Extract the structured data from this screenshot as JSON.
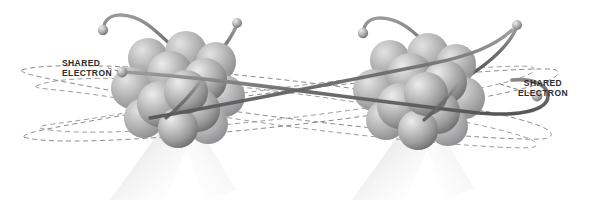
{
  "diagram": {
    "background_color": "#ffffff",
    "labels": [
      {
        "id": "left",
        "line1": "SHARED",
        "line2": "ELECTRON"
      },
      {
        "id": "right",
        "line1": "SHARED",
        "line2": "ELECTRON"
      }
    ],
    "colors": {
      "nucleon_light": "#d8d8d8",
      "nucleon_mid": "#a8a8a8",
      "nucleon_dark": "#767676",
      "orbit_dashed": "#8c8c8c",
      "bond_rod": "#6f6f6f",
      "electron": "#b5b5b5",
      "label_text": "#2b2b2b",
      "shadow": "#d9d9d9"
    },
    "atoms": [
      {
        "id": "atom-left",
        "center_x": 175,
        "center_y": 90,
        "nucleon_count": 13
      },
      {
        "id": "atom-right",
        "center_x": 415,
        "center_y": 92,
        "nucleon_count": 13
      }
    ],
    "electrons": [
      {
        "id": "electron-left-upper-left",
        "x": 103,
        "y": 30
      },
      {
        "id": "electron-left-upper-right",
        "x": 237,
        "y": 23
      },
      {
        "id": "electron-left-shared",
        "x": 122,
        "y": 72
      },
      {
        "id": "electron-right-upper-left",
        "x": 363,
        "y": 33
      },
      {
        "id": "electron-right-upper-right",
        "x": 517,
        "y": 25
      },
      {
        "id": "electron-right-shared",
        "x": 537,
        "y": 96
      }
    ],
    "orbit_count": 4,
    "bond_description": "shared electron rod spanning both nuclei"
  }
}
